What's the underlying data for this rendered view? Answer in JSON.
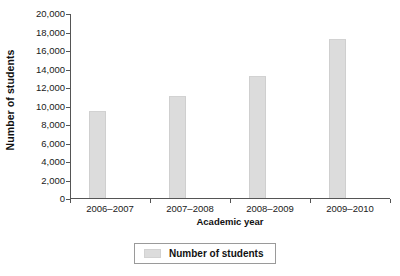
{
  "chart_data": {
    "type": "bar",
    "title": "",
    "xlabel": "Academic year",
    "ylabel": "Number of students",
    "categories": [
      "2006–2007",
      "2007–2008",
      "2008–2009",
      "2009–2010"
    ],
    "values": [
      9300,
      10900,
      13100,
      17100
    ],
    "series": [
      {
        "name": "Number of students",
        "values": [
          9300,
          10900,
          13100,
          17100
        ]
      }
    ],
    "ylim": [
      0,
      20000
    ],
    "ytick_values": [
      0,
      2000,
      4000,
      6000,
      8000,
      10000,
      12000,
      14000,
      16000,
      18000,
      20000
    ],
    "ytick_labels": [
      "0",
      "2,000",
      "4,000",
      "6,000",
      "8,000",
      "10,000",
      "12,000",
      "14,000",
      "16,000",
      "18,000",
      "20,000"
    ],
    "grid": false,
    "legend_position": "bottom-center",
    "legend_entries": [
      "Number of students"
    ],
    "bar_color": "#dcdcdc",
    "axis_color": "#555555"
  },
  "legend": {
    "label": "Number of students"
  },
  "axes": {
    "x_title": "Academic year",
    "y_title": "Number of students"
  }
}
